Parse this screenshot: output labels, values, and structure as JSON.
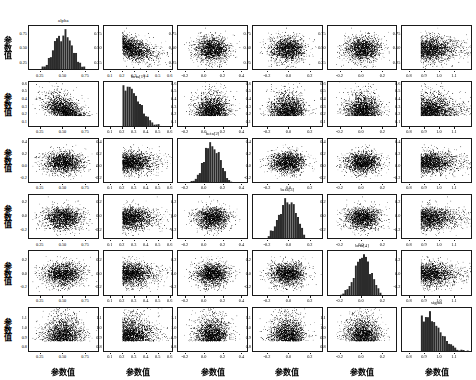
{
  "figure": {
    "type": "pairs-scatterplot-matrix",
    "n_variables": 6,
    "background_color": "#ffffff",
    "point_color": "#000000",
    "hist_fill_color": "#2b2b2b",
    "axis_color": "#1a1a1a",
    "x_axis_label": "参数值",
    "y_axis_label": "参数值"
  },
  "variables": [
    {
      "name": "alpha",
      "label": "alpha",
      "mean": 0.5,
      "sd": 0.105,
      "range": [
        0.13,
        0.88
      ],
      "ticks": [
        "0.25",
        "0.50",
        "0.75"
      ],
      "tick_values": [
        0.25,
        0.5,
        0.75
      ],
      "axis_min": 0.12,
      "axis_max": 0.9
    },
    {
      "name": "beta1",
      "label": "beta[1]",
      "mean": 0.3,
      "sd": 0.075,
      "range": [
        0.05,
        0.62
      ],
      "ticks": [
        "0.1",
        "0.2",
        "0.3",
        "0.4",
        "0.5",
        "0.6"
      ],
      "tick_values": [
        0.1,
        0.2,
        0.3,
        0.4,
        0.5,
        0.6
      ],
      "axis_min": 0.04,
      "axis_max": 0.63
    },
    {
      "name": "beta2",
      "label": "beta[2]",
      "mean": 0.08,
      "sd": 0.085,
      "range": [
        -0.25,
        0.45
      ],
      "ticks": [
        "-0.2",
        "0.0",
        "0.2",
        "0.4"
      ],
      "tick_values": [
        -0.2,
        0.0,
        0.2,
        0.4
      ],
      "axis_min": -0.28,
      "axis_max": 0.47
    },
    {
      "name": "beta3",
      "label": "beta[3]",
      "mean": -0.02,
      "sd": 0.08,
      "range": [
        -0.32,
        0.3
      ],
      "ticks": [
        "-0.2",
        "0.0",
        "0.2"
      ],
      "tick_values": [
        -0.2,
        0.0,
        0.2
      ],
      "axis_min": -0.34,
      "axis_max": 0.32
    },
    {
      "name": "beta4",
      "label": "beta[4]",
      "mean": 0.01,
      "sd": 0.08,
      "range": [
        -0.3,
        0.32
      ],
      "ticks": [
        "-0.2",
        "0.0",
        "0.2"
      ],
      "tick_values": [
        -0.2,
        0.0,
        0.2
      ],
      "axis_min": -0.32,
      "axis_max": 0.34
    },
    {
      "name": "sigma",
      "label": "sigma",
      "mean": 0.97,
      "sd": 0.07,
      "range": [
        0.76,
        1.2
      ],
      "ticks": [
        "0.8",
        "0.9",
        "1.0",
        "1.1"
      ],
      "tick_values": [
        0.8,
        0.9,
        1.0,
        1.1
      ],
      "axis_min": 0.75,
      "axis_max": 1.22
    }
  ],
  "chart_data": {
    "type": "scatter",
    "title": "",
    "xlabel": "参数值",
    "ylabel": "参数值",
    "grid": false,
    "legend": "none",
    "n_points_per_panel": 2000,
    "diagonal": "histogram",
    "panel_titles": [
      "alpha",
      "beta[1]",
      "beta[2]",
      "beta[3]",
      "beta[4]",
      "sigma"
    ],
    "series": [
      {
        "name": "alpha",
        "mean": 0.5,
        "sd": 0.105,
        "ticks": [
          0.25,
          0.5,
          0.75
        ],
        "ylim": [
          0.12,
          0.9
        ]
      },
      {
        "name": "beta[1]",
        "mean": 0.3,
        "sd": 0.075,
        "ticks": [
          0.1,
          0.2,
          0.3,
          0.4,
          0.5,
          0.6
        ],
        "ylim": [
          0.04,
          0.63
        ]
      },
      {
        "name": "beta[2]",
        "mean": 0.08,
        "sd": 0.085,
        "ticks": [
          -0.2,
          0.0,
          0.2,
          0.4
        ],
        "ylim": [
          -0.28,
          0.47
        ]
      },
      {
        "name": "beta[3]",
        "mean": -0.02,
        "sd": 0.08,
        "ticks": [
          -0.2,
          0.0,
          0.2
        ],
        "ylim": [
          -0.34,
          0.32
        ]
      },
      {
        "name": "beta[4]",
        "mean": 0.01,
        "sd": 0.08,
        "ticks": [
          -0.2,
          0.0,
          0.2
        ],
        "ylim": [
          -0.32,
          0.34
        ]
      },
      {
        "name": "sigma",
        "mean": 0.97,
        "sd": 0.07,
        "ticks": [
          0.8,
          0.9,
          1.0,
          1.1
        ],
        "ylim": [
          0.75,
          1.22
        ]
      }
    ],
    "correlation_matrix": [
      [
        1.0,
        -0.42,
        -0.05,
        0.02,
        -0.03,
        0.01
      ],
      [
        -0.42,
        1.0,
        0.03,
        -0.02,
        0.01,
        -0.01
      ],
      [
        -0.05,
        0.03,
        1.0,
        0.02,
        0.01,
        0.0
      ],
      [
        0.02,
        -0.02,
        0.02,
        1.0,
        -0.01,
        0.01
      ],
      [
        -0.03,
        0.01,
        0.01,
        -0.01,
        1.0,
        0.0
      ],
      [
        0.01,
        -0.01,
        0.0,
        0.01,
        0.0,
        1.0
      ]
    ]
  },
  "axis_labels": {
    "bottom": [
      "参数值",
      "参数值",
      "参数值",
      "参数值",
      "参数值",
      "参数值"
    ],
    "left": [
      "参数值",
      "参数值",
      "参数值",
      "参数值",
      "参数值",
      "参数值"
    ]
  }
}
